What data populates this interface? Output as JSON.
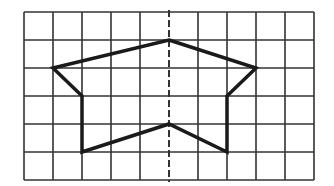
{
  "diagram": {
    "type": "grid-figure",
    "grid": {
      "columns": 10,
      "rows": 6,
      "origin_x": 24,
      "origin_y": 12,
      "cell_width": 29,
      "cell_height": 28,
      "line_color": "#333333",
      "line_width": 1.6
    },
    "symmetry_axis": {
      "column_index": 5,
      "style": "dashed",
      "color": "#333333"
    },
    "figure": {
      "shape": "concave-pentagon-like polygon",
      "stroke_color": "#1a1a1a",
      "stroke_width": 3.5,
      "vertices_grid": [
        [
          5,
          1
        ],
        [
          8,
          2
        ],
        [
          7,
          3
        ],
        [
          7,
          5
        ],
        [
          5,
          4
        ],
        [
          2,
          5
        ],
        [
          2,
          3
        ],
        [
          1,
          2
        ]
      ]
    }
  }
}
